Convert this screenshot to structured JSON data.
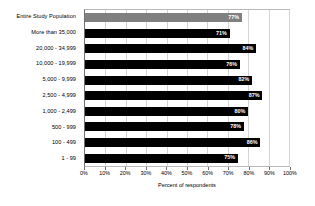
{
  "chart_data": {
    "type": "bar",
    "orientation": "horizontal",
    "title": "",
    "xlabel": "Percent of respondents",
    "ylabel": "",
    "xlim": [
      0,
      100
    ],
    "xticks": [
      "0%",
      "10%",
      "20%",
      "30%",
      "40%",
      "50%",
      "60%",
      "70%",
      "80%",
      "90%",
      "100%"
    ],
    "xtick_values": [
      0,
      10,
      20,
      30,
      40,
      50,
      60,
      70,
      80,
      90,
      100
    ],
    "grid": true,
    "grid_axis": "x",
    "legend": false,
    "categories": [
      "Entire Study Population",
      "More than 35,000",
      "20,000 - 34,999",
      "10,000 - 19,999",
      "5,000 - 9,999",
      "2,500 - 4,999",
      "1,000 - 2,499",
      "500 - 999",
      "100 - 499",
      "1 - 99"
    ],
    "values": [
      77,
      71,
      84,
      76,
      82,
      87,
      80,
      78,
      86,
      75
    ],
    "labels": [
      "77%",
      "71%",
      "84%",
      "76%",
      "82%",
      "87%",
      "80%",
      "78%",
      "86%",
      "75%"
    ],
    "bar_colors": [
      "#808080",
      "#000000",
      "#000000",
      "#000000",
      "#000000",
      "#000000",
      "#000000",
      "#000000",
      "#000000",
      "#000000"
    ],
    "value_label_color": "#ffffff",
    "plot_border_color": "#b9b9b9",
    "gridline_color": "#d4d4d4",
    "background_color": "#ffffff"
  }
}
